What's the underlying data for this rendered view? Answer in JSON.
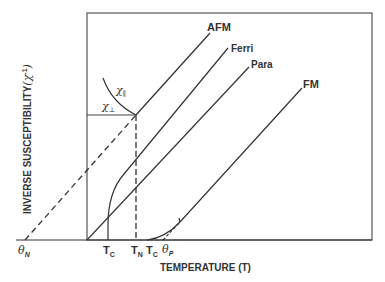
{
  "diagram": {
    "axes": {
      "ylabel": "INVERSE SUSCEPTIBILITY",
      "ylabel_symbol": "(χ",
      "ylabel_exp": "-1",
      "ylabel_close": ")",
      "xlabel": "TEMPERATURE (T)"
    },
    "curves": {
      "afm": "AFM",
      "ferri": "Ferri",
      "para": "Para",
      "fm": "FM"
    },
    "branches": {
      "chi_parallel": "χ",
      "chi_parallel_sub": "∥",
      "chi_perp": "χ",
      "chi_perp_sub": "⊥"
    },
    "ticks": {
      "theta_n": "θ",
      "theta_n_sub": "N",
      "tc_ferri": "T",
      "tc_ferri_sub": "C",
      "tn": "T",
      "tn_sub": "N",
      "tc_fm": "T",
      "tc_fm_sub": "C",
      "theta_p": "θ",
      "theta_p_sub": "P"
    },
    "colors": {
      "line": "#333333",
      "frame": "#555555"
    }
  }
}
